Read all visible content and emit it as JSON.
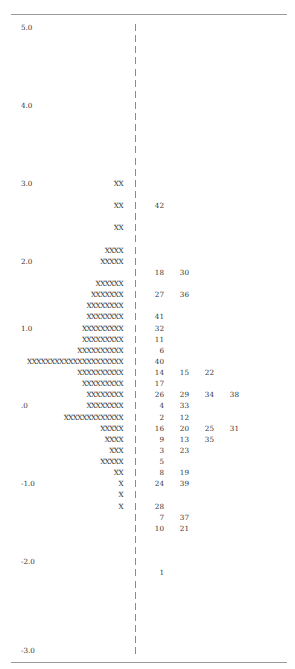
{
  "chart_data": {
    "type": "table",
    "xlabel": "",
    "ylabel": "Measure (logits)",
    "ylim": [
      -3.0,
      5.0
    ],
    "scale_labels": [
      {
        "row": 0,
        "label": "5.0"
      },
      {
        "row": 7,
        "label": "4.0"
      },
      {
        "row": 14,
        "label": "3.0"
      },
      {
        "row": 21,
        "label": "2.0"
      },
      {
        "row": 28,
        "label": "1.0"
      },
      {
        "row": 35,
        "label": ".0"
      },
      {
        "row": 42,
        "label": "-1.0"
      },
      {
        "row": 49,
        "label": "-2.0"
      },
      {
        "row": 56,
        "label": "-3.0"
      }
    ],
    "rows": [
      {
        "row": 0,
        "scale": "5.0",
        "persons": "",
        "items": []
      },
      {
        "row": 1,
        "scale": "",
        "persons": "",
        "items": []
      },
      {
        "row": 2,
        "scale": "",
        "persons": "",
        "items": []
      },
      {
        "row": 3,
        "scale": "",
        "persons": "",
        "items": []
      },
      {
        "row": 4,
        "scale": "",
        "persons": "",
        "items": []
      },
      {
        "row": 5,
        "scale": "",
        "persons": "",
        "items": []
      },
      {
        "row": 6,
        "scale": "",
        "persons": "",
        "items": []
      },
      {
        "row": 7,
        "scale": "4.0",
        "persons": "",
        "items": []
      },
      {
        "row": 8,
        "scale": "",
        "persons": "",
        "items": []
      },
      {
        "row": 9,
        "scale": "",
        "persons": "",
        "items": []
      },
      {
        "row": 10,
        "scale": "",
        "persons": "",
        "items": []
      },
      {
        "row": 11,
        "scale": "",
        "persons": "",
        "items": []
      },
      {
        "row": 12,
        "scale": "",
        "persons": "",
        "items": []
      },
      {
        "row": 13,
        "scale": "",
        "persons": "",
        "items": []
      },
      {
        "row": 14,
        "scale": "3.0",
        "persons": "XX",
        "items": []
      },
      {
        "row": 15,
        "scale": "",
        "persons": "",
        "items": []
      },
      {
        "row": 16,
        "scale": "",
        "persons": "XX",
        "items": [
          "42"
        ]
      },
      {
        "row": 17,
        "scale": "",
        "persons": "",
        "items": []
      },
      {
        "row": 18,
        "scale": "",
        "persons": "XX",
        "items": []
      },
      {
        "row": 19,
        "scale": "",
        "persons": "",
        "items": []
      },
      {
        "row": 20,
        "scale": "",
        "persons": "XXXX",
        "items": []
      },
      {
        "row": 21,
        "scale": "2.0",
        "persons": "XXXXX",
        "items": []
      },
      {
        "row": 22,
        "scale": "",
        "persons": "",
        "items": [
          "18",
          "30"
        ]
      },
      {
        "row": 23,
        "scale": "",
        "persons": "XXXXXX",
        "items": []
      },
      {
        "row": 24,
        "scale": "",
        "persons": "XXXXXXX",
        "items": [
          "27",
          "36"
        ]
      },
      {
        "row": 25,
        "scale": "",
        "persons": "XXXXXXXX",
        "items": []
      },
      {
        "row": 26,
        "scale": "",
        "persons": "XXXXXXXX",
        "items": [
          "41"
        ]
      },
      {
        "row": 27,
        "scale": "1.0",
        "persons": "XXXXXXXXX",
        "items": [
          "32"
        ]
      },
      {
        "row": 28,
        "scale": "",
        "persons": "XXXXXXXXX",
        "items": [
          "11"
        ]
      },
      {
        "row": 29,
        "scale": "",
        "persons": "XXXXXXXXXX",
        "items": [
          "6"
        ]
      },
      {
        "row": 30,
        "scale": "",
        "persons": "XXXXXXXXXXXXXXXXXXXXX",
        "items": [
          "40"
        ]
      },
      {
        "row": 31,
        "scale": "",
        "persons": "XXXXXXXXXX",
        "items": [
          "14",
          "15",
          "22"
        ]
      },
      {
        "row": 32,
        "scale": "",
        "persons": "XXXXXXXXX",
        "items": [
          "17"
        ]
      },
      {
        "row": 33,
        "scale": "",
        "persons": "XXXXXXXX",
        "items": [
          "26",
          "29",
          "34",
          "38"
        ]
      },
      {
        "row": 34,
        "scale": ".0",
        "persons": "XXXXXXXX",
        "items": [
          "4",
          "33"
        ]
      },
      {
        "row": 35,
        "scale": "",
        "persons": "XXXXXXXXXXXXX",
        "items": [
          "2",
          "12"
        ]
      },
      {
        "row": 36,
        "scale": "",
        "persons": "XXXXX",
        "items": [
          "16",
          "20",
          "25",
          "31"
        ]
      },
      {
        "row": 37,
        "scale": "",
        "persons": "XXXX",
        "items": [
          "9",
          "13",
          "35"
        ]
      },
      {
        "row": 38,
        "scale": "",
        "persons": "XXX",
        "items": [
          "3",
          "23"
        ]
      },
      {
        "row": 39,
        "scale": "",
        "persons": "XXXXX",
        "items": [
          "5"
        ]
      },
      {
        "row": 40,
        "scale": "",
        "persons": "XX",
        "items": [
          "8",
          "19"
        ]
      },
      {
        "row": 41,
        "scale": "-1.0",
        "persons": "X",
        "items": [
          "24",
          "39"
        ]
      },
      {
        "row": 42,
        "scale": "",
        "persons": "X",
        "items": []
      },
      {
        "row": 43,
        "scale": "",
        "persons": "X",
        "items": [
          "28"
        ]
      },
      {
        "row": 44,
        "scale": "",
        "persons": "",
        "items": [
          "7",
          "37"
        ]
      },
      {
        "row": 45,
        "scale": "",
        "persons": "",
        "items": [
          "10",
          "21"
        ]
      },
      {
        "row": 46,
        "scale": "",
        "persons": "",
        "items": []
      },
      {
        "row": 47,
        "scale": "",
        "persons": "",
        "items": []
      },
      {
        "row": 48,
        "scale": "-2.0",
        "persons": "",
        "items": []
      },
      {
        "row": 49,
        "scale": "",
        "persons": "",
        "items": [
          "1"
        ]
      },
      {
        "row": 50,
        "scale": "",
        "persons": "",
        "items": []
      },
      {
        "row": 51,
        "scale": "",
        "persons": "",
        "items": []
      },
      {
        "row": 52,
        "scale": "",
        "persons": "",
        "items": []
      },
      {
        "row": 53,
        "scale": "",
        "persons": "",
        "items": []
      },
      {
        "row": 54,
        "scale": "",
        "persons": "",
        "items": []
      },
      {
        "row": 55,
        "scale": "",
        "persons": "",
        "items": []
      },
      {
        "row": 56,
        "scale": "-3.0",
        "persons": "",
        "items": []
      }
    ],
    "grid": false,
    "legend": "none"
  },
  "style": {
    "text_color": "#333333",
    "axis_color": "#8a8a8a",
    "rule_color": "#9a9a9a",
    "row_pitch_px": 11.13,
    "item_column_x": [
      150,
      175,
      200,
      225
    ]
  }
}
